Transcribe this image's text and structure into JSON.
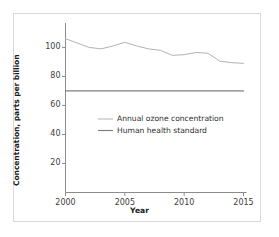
{
  "chart_data": {
    "type": "line",
    "title": "",
    "xlabel": "Year",
    "ylabel": "Concentration, parts per billion",
    "xlim": [
      2000,
      2015
    ],
    "ylim": [
      0,
      112
    ],
    "xticks": [
      "2000",
      "2005",
      "2010",
      "2015"
    ],
    "xtick_values": [
      2000,
      2005,
      2010,
      2015
    ],
    "yticks": [
      "20",
      "40",
      "60",
      "80",
      "100"
    ],
    "ytick_values": [
      20,
      40,
      60,
      80,
      100
    ],
    "grid": false,
    "legend_position": "center-right-inside",
    "x": [
      2000,
      2001,
      2002,
      2003,
      2004,
      2005,
      2006,
      2007,
      2008,
      2009,
      2010,
      2011,
      2012,
      2013,
      2014,
      2015
    ],
    "series": [
      {
        "name": "Annual ozone concentration",
        "color": "#b3b3b3",
        "values": [
          106,
          103,
          100,
          99,
          101,
          103.5,
          101,
          99,
          98,
          94.5,
          95,
          96.5,
          96,
          90.5,
          89.5,
          89
        ]
      },
      {
        "name": "Human health standard",
        "color": "#808080",
        "values": [
          70,
          70,
          70,
          70,
          70,
          70,
          70,
          70,
          70,
          70,
          70,
          70,
          70,
          70,
          70,
          70
        ]
      }
    ]
  },
  "legend": {
    "entries": [
      {
        "label": "Annual ozone concentration",
        "color": "#b3b3b3"
      },
      {
        "label": "Human health standard",
        "color": "#808080"
      }
    ]
  },
  "axes": {
    "y_title": "Concentration, parts per billion",
    "x_title": "Year",
    "axis_color": "#8c8c8c"
  },
  "colors": {
    "frame": "#d9d9d9",
    "background": "#ffffff",
    "text": "#1b1b1b",
    "tick_text": "#3d3d3d"
  }
}
